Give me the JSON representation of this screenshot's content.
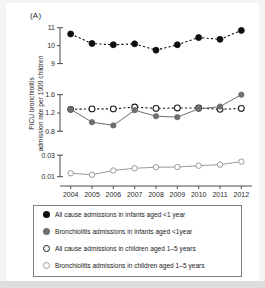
{
  "figure": {
    "panel_label": "(A)",
    "ylabel_line1": "PICU bronchiolitis",
    "ylabel_line2": "admission rate per 1000 children"
  },
  "legend": {
    "items": [
      {
        "marker": "filled-dark-circle",
        "label": "All cause admissions in infants aged <1 year"
      },
      {
        "marker": "filled-gray-circle",
        "label": "Bronchiolitis admissions in infants aged <1year"
      },
      {
        "marker": "open-dark-circle",
        "label": "All cause admissions in children aged 1–5 years"
      },
      {
        "marker": "open-gray-circle",
        "label": "Bronchiolitis admissions in children aged 1–5 years"
      }
    ]
  },
  "colors": {
    "all_cause_infants": "#0d0d0d",
    "bronchiolitis_infants": "#6f6f6f",
    "all_cause_children": "#1b1b1b",
    "bronchiolitis_children": "#9a9a9a",
    "axis": "#4a4a4a",
    "panel_background": "#ffffff",
    "figure_background": "#f4f4f3"
  },
  "chart_data": {
    "type": "line",
    "title": "",
    "xlabel": "",
    "ylabel": "PICU bronchiolitis admission rate per 1000 children",
    "grid": false,
    "legend_position": "bottom",
    "x": [
      2004,
      2005,
      2006,
      2007,
      2008,
      2009,
      2010,
      2011,
      2012
    ],
    "categories": [
      "2004",
      "2005",
      "2006",
      "2007",
      "2008",
      "2009",
      "2010",
      "2011",
      "2012"
    ],
    "broken_axis": true,
    "panels": [
      {
        "name": "top",
        "ylim": [
          8.7,
          11.15
        ],
        "yticks": [
          9,
          10,
          11
        ],
        "yticklabels": [
          "9",
          "10",
          "11"
        ],
        "series": [
          {
            "name": "All cause admissions in infants aged <1 year",
            "marker": "filled-dark-circle",
            "linestyle": "dashed",
            "values": [
              10.65,
              10.12,
              10.05,
              10.1,
              9.75,
              10.05,
              10.45,
              10.35,
              10.85
            ]
          }
        ]
      },
      {
        "name": "middle",
        "ylim": [
          0.72,
          1.68
        ],
        "yticks": [
          0.8,
          1.2,
          1.6
        ],
        "yticklabels": [
          "0.8",
          "1.2",
          "1.6"
        ],
        "series": [
          {
            "name": "All cause admissions in children aged 1–5 years",
            "marker": "open-dark-circle",
            "linestyle": "dashed",
            "values": [
              1.28,
              1.29,
              1.29,
              1.33,
              1.3,
              1.31,
              1.31,
              1.28,
              1.3
            ]
          },
          {
            "name": "Bronchiolitis admissions in infants aged <1year",
            "marker": "filled-gray-circle",
            "linestyle": "solid",
            "values": [
              1.28,
              1.0,
              0.93,
              1.26,
              1.13,
              1.11,
              1.29,
              1.34,
              1.6
            ]
          }
        ]
      },
      {
        "name": "bottom",
        "ylim": [
          0.006,
          0.032
        ],
        "yticks": [
          0.01,
          0.03
        ],
        "yticklabels": [
          "0.01",
          "0.03"
        ],
        "series": [
          {
            "name": "Bronchiolitis admissions in children aged 1–5 years",
            "marker": "open-gray-circle",
            "linestyle": "solid",
            "values": [
              0.0132,
              0.0118,
              0.0158,
              0.0178,
              0.0188,
              0.019,
              0.0202,
              0.0212,
              0.024
            ]
          }
        ]
      }
    ]
  }
}
